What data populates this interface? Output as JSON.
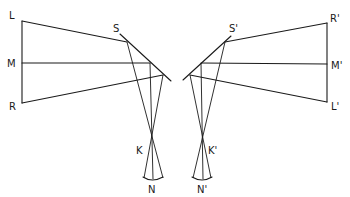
{
  "diagram": {
    "type": "optics-ray-diagram",
    "line_color": "#1a1a1a",
    "background": "#ffffff",
    "left": {
      "labels": {
        "L": "L",
        "M": "M",
        "R": "R",
        "S": "S",
        "K": "K",
        "N": "N"
      },
      "points": {
        "L": [
          22,
          21
        ],
        "M": [
          22,
          63
        ],
        "R": [
          22,
          103
        ],
        "mirror_start": [
          120,
          34
        ],
        "mirror_end": [
          170,
          80
        ],
        "reflect_L": [
          127,
          42
        ],
        "reflect_M": [
          150,
          63
        ],
        "reflect_R": [
          163,
          75
        ],
        "K": [
          152,
          147
        ],
        "N": [
          152,
          179
        ]
      }
    },
    "right": {
      "labels": {
        "R": "R'",
        "M": "M'",
        "L": "L'",
        "S": "S'",
        "K": "K'",
        "N": "N'"
      },
      "points": {
        "R": [
          327,
          23
        ],
        "M": [
          327,
          64
        ],
        "L": [
          327,
          102
        ],
        "mirror_start": [
          231,
          36
        ],
        "mirror_end": [
          183,
          80
        ],
        "reflect_R": [
          225,
          42
        ],
        "reflect_M": [
          201,
          63
        ],
        "reflect_L": [
          190,
          75
        ],
        "K": [
          202,
          147
        ],
        "N": [
          202,
          179
        ]
      }
    }
  }
}
